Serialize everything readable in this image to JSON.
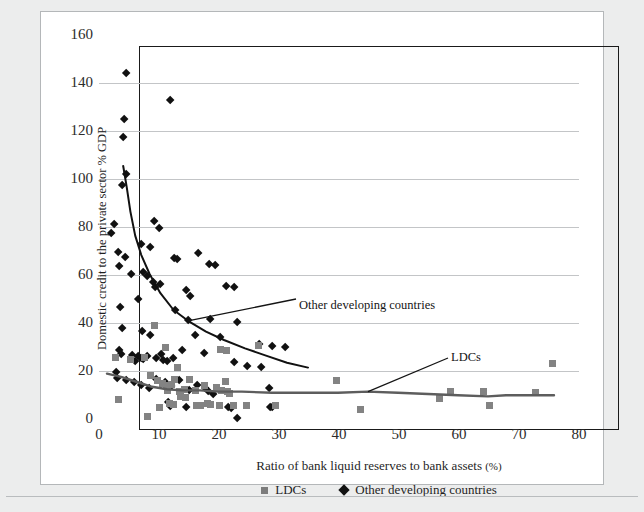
{
  "figure": {
    "background_color": "#eceded",
    "panel_color": "#ffffff",
    "panel_border_color": "#b4b7b9"
  },
  "annotations": [
    {
      "name": "annot-other-developing-countries",
      "text": "Other developing countries"
    },
    {
      "name": "annot-ldcs",
      "text": "LDCs"
    }
  ],
  "legend": {
    "position": "bottom-center",
    "entries": [
      {
        "label": "LDCs",
        "marker": "square",
        "color": "#7c7c7c"
      },
      {
        "label": "Other developing countries",
        "marker": "diamond",
        "color": "#121212"
      }
    ]
  },
  "chart_data": {
    "type": "scatter",
    "title": "",
    "subtitle": "",
    "xlabel": "Ratio of bank liquid reserves to bank assets",
    "xlabel_unit": "(%)",
    "ylabel": "Domestic credit to the private sector % GDP",
    "xlim": [
      0,
      80
    ],
    "ylim": [
      0,
      160
    ],
    "xticks": [
      0,
      10,
      20,
      30,
      40,
      50,
      60,
      70,
      80
    ],
    "yticks": [
      0,
      20,
      40,
      60,
      80,
      100,
      120,
      140,
      160
    ],
    "grid": "horizontal",
    "legend_position": "bottom-center",
    "series": [
      {
        "name": "Other developing countries",
        "marker": "diamond",
        "color": "#111111",
        "points": [
          [
            4.6,
            144.0
          ],
          [
            11.8,
            133.0
          ],
          [
            4.2,
            125.0
          ],
          [
            4.0,
            117.5
          ],
          [
            4.6,
            102.0
          ],
          [
            3.9,
            97.5
          ],
          [
            2.6,
            81.0
          ],
          [
            2.1,
            77.5
          ],
          [
            9.2,
            82.5
          ],
          [
            10.0,
            79.5
          ],
          [
            3.2,
            69.5
          ],
          [
            4.3,
            67.5
          ],
          [
            8.5,
            71.5
          ],
          [
            3.4,
            63.5
          ],
          [
            7.1,
            73.0
          ],
          [
            5.3,
            60.5
          ],
          [
            7.4,
            61.0
          ],
          [
            8.0,
            59.5
          ],
          [
            9.0,
            57.0
          ],
          [
            9.3,
            55.0
          ],
          [
            10.2,
            56.0
          ],
          [
            12.6,
            67.0
          ],
          [
            13.0,
            66.5
          ],
          [
            16.5,
            69.0
          ],
          [
            18.4,
            64.5
          ],
          [
            19.3,
            64.0
          ],
          [
            21.2,
            55.5
          ],
          [
            22.6,
            55.0
          ],
          [
            14.5,
            53.5
          ],
          [
            15.2,
            51.0
          ],
          [
            3.6,
            46.5
          ],
          [
            6.6,
            50.0
          ],
          [
            12.7,
            45.5
          ],
          [
            14.8,
            41.0
          ],
          [
            18.6,
            41.5
          ],
          [
            23.0,
            40.5
          ],
          [
            3.8,
            38.0
          ],
          [
            7.2,
            36.5
          ],
          [
            8.6,
            35.0
          ],
          [
            16.0,
            35.0
          ],
          [
            20.2,
            34.0
          ],
          [
            26.7,
            31.0
          ],
          [
            28.8,
            30.5
          ],
          [
            31.0,
            30.0
          ],
          [
            3.3,
            28.5
          ],
          [
            3.7,
            27.0
          ],
          [
            5.6,
            26.5
          ],
          [
            6.5,
            26.0
          ],
          [
            7.0,
            25.5
          ],
          [
            7.3,
            25.0
          ],
          [
            8.0,
            26.0
          ],
          [
            9.5,
            25.5
          ],
          [
            10.4,
            27.0
          ],
          [
            10.7,
            24.5
          ],
          [
            11.3,
            24.0
          ],
          [
            12.3,
            25.5
          ],
          [
            6.0,
            24.0
          ],
          [
            13.8,
            28.5
          ],
          [
            17.5,
            27.5
          ],
          [
            22.5,
            23.5
          ],
          [
            24.7,
            22.0
          ],
          [
            27.0,
            21.5
          ],
          [
            2.8,
            19.5
          ],
          [
            3.0,
            17.0
          ],
          [
            4.5,
            16.0
          ],
          [
            5.8,
            15.5
          ],
          [
            7.0,
            14.0
          ],
          [
            8.3,
            13.0
          ],
          [
            9.6,
            16.5
          ],
          [
            11.0,
            15.5
          ],
          [
            12.0,
            13.5
          ],
          [
            13.4,
            16.0
          ],
          [
            15.0,
            12.0
          ],
          [
            16.4,
            14.0
          ],
          [
            17.7,
            13.0
          ],
          [
            18.2,
            11.5
          ],
          [
            19.0,
            10.5
          ],
          [
            11.6,
            7.0
          ],
          [
            11.9,
            5.5
          ],
          [
            14.6,
            5.0
          ],
          [
            21.6,
            5.0
          ],
          [
            22.0,
            4.5
          ],
          [
            23.0,
            0.5
          ],
          [
            28.4,
            13.0
          ],
          [
            28.6,
            5.0
          ],
          [
            28.9,
            5.0
          ]
        ]
      },
      {
        "name": "LDCs",
        "marker": "square",
        "color": "#838383",
        "points": [
          [
            9.2,
            39.0
          ],
          [
            2.7,
            25.5
          ],
          [
            5.2,
            25.0
          ],
          [
            7.6,
            25.5
          ],
          [
            11.0,
            30.0
          ],
          [
            13.0,
            21.5
          ],
          [
            20.3,
            29.0
          ],
          [
            21.2,
            28.5
          ],
          [
            26.6,
            30.5
          ],
          [
            8.6,
            18.0
          ],
          [
            9.8,
            16.0
          ],
          [
            10.6,
            15.0
          ],
          [
            11.2,
            14.0
          ],
          [
            11.4,
            12.0
          ],
          [
            12.0,
            14.5
          ],
          [
            12.5,
            16.5
          ],
          [
            13.4,
            11.5
          ],
          [
            14.2,
            12.5
          ],
          [
            15.0,
            16.5
          ],
          [
            16.0,
            12.0
          ],
          [
            17.5,
            14.0
          ],
          [
            19.6,
            13.0
          ],
          [
            20.4,
            12.0
          ],
          [
            21.0,
            15.5
          ],
          [
            21.4,
            11.5
          ],
          [
            21.8,
            10.5
          ],
          [
            3.3,
            8.0
          ],
          [
            10.0,
            5.0
          ],
          [
            11.8,
            6.5
          ],
          [
            12.4,
            6.0
          ],
          [
            13.5,
            9.5
          ],
          [
            14.4,
            9.0
          ],
          [
            16.2,
            5.5
          ],
          [
            16.9,
            5.5
          ],
          [
            18.0,
            6.5
          ],
          [
            18.6,
            6.0
          ],
          [
            20.0,
            5.5
          ],
          [
            22.4,
            5.5
          ],
          [
            24.5,
            5.5
          ],
          [
            29.4,
            5.5
          ],
          [
            8.0,
            1.0
          ],
          [
            39.5,
            16.0
          ],
          [
            43.5,
            4.0
          ],
          [
            56.8,
            8.5
          ],
          [
            58.6,
            11.5
          ],
          [
            64.0,
            11.5
          ],
          [
            65.0,
            5.5
          ],
          [
            72.8,
            11.0
          ],
          [
            75.5,
            23.0
          ]
        ]
      }
    ],
    "trendlines": [
      {
        "name": "Other developing countries trend",
        "color": "#111111",
        "points": [
          [
            4.2,
            105.0
          ],
          [
            4.8,
            96.0
          ],
          [
            5.4,
            86.0
          ],
          [
            6.2,
            76.0
          ],
          [
            7.2,
            68.0
          ],
          [
            8.6,
            60.0
          ],
          [
            10.4,
            52.0
          ],
          [
            12.6,
            45.0
          ],
          [
            15.0,
            40.5
          ],
          [
            18.0,
            36.0
          ],
          [
            21.0,
            32.5
          ],
          [
            24.5,
            29.0
          ],
          [
            28.0,
            26.0
          ],
          [
            31.5,
            23.0
          ],
          [
            35.0,
            21.0
          ]
        ]
      },
      {
        "name": "LDCs trend",
        "color": "#5d5d5d",
        "points": [
          [
            1.5,
            18.5
          ],
          [
            4.0,
            17.0
          ],
          [
            6.5,
            15.0
          ],
          [
            9.0,
            13.0
          ],
          [
            11.5,
            12.0
          ],
          [
            14.0,
            11.5
          ],
          [
            17.0,
            11.5
          ],
          [
            20.0,
            11.0
          ],
          [
            24.0,
            11.0
          ],
          [
            29.0,
            10.5
          ],
          [
            34.0,
            10.5
          ],
          [
            40.0,
            10.5
          ],
          [
            45.0,
            11.0
          ],
          [
            50.0,
            10.5
          ],
          [
            55.0,
            10.0
          ],
          [
            60.0,
            9.5
          ],
          [
            65.0,
            9.0
          ],
          [
            68.0,
            9.5
          ],
          [
            72.0,
            9.5
          ],
          [
            76.0,
            9.5
          ]
        ]
      }
    ]
  }
}
